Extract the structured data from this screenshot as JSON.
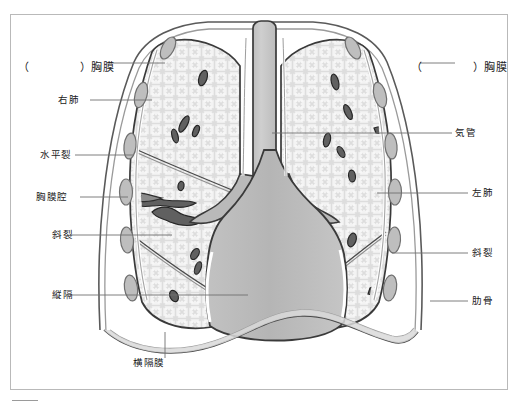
{
  "figure": {
    "title_visible": false,
    "frame": {
      "stroke": "#b9b9b9"
    },
    "colors": {
      "lung_fill": "#f2f2f2",
      "lung_mesh": "#d6d6d6",
      "lung_outline": "#3a3a3a",
      "pleura_fill": "#c9c9c9",
      "mediastinum_fill": "#b9b9b9",
      "mediastinum_outline": "#3a3a3a",
      "trachea_fill": "#c3c3c3",
      "rib_fill": "#bdbdbd",
      "rib_outline": "#6e6e6e",
      "vessel_fill": "#5f5f5f",
      "vessel_outline": "#2a2a2a",
      "diaphragm_fill": "#d8d8d8",
      "leader_line": "#6b6b6b",
      "text": "#1b1b1b"
    }
  },
  "labels": {
    "left": [
      {
        "id": "pleura-left-blank",
        "text": "）胸膜",
        "prefix": "（",
        "blank": true,
        "x": 18,
        "y": 66,
        "leader_to_x": 160
      },
      {
        "id": "right-lung",
        "text": "右肺",
        "x": 58,
        "y": 97,
        "leader_to_x": 152
      },
      {
        "id": "horizontal-fissure",
        "text": "水平裂",
        "x": 40,
        "y": 152,
        "leader_to_x": 133
      },
      {
        "id": "pleural-cavity",
        "text": "胸膜腔",
        "x": 36,
        "y": 194,
        "leader_to_x": 128
      },
      {
        "id": "oblique-fissure-l",
        "text": "斜裂",
        "x": 52,
        "y": 232,
        "leader_to_x": 170
      },
      {
        "id": "mediastinum",
        "text": "縦隔",
        "x": 52,
        "y": 292,
        "leader_to_x": 245
      }
    ],
    "right": [
      {
        "id": "pleura-right-blank",
        "text": "）胸膜",
        "prefix": "（",
        "blank": true,
        "x": 463,
        "y": 66,
        "leader_to_x": 400
      },
      {
        "id": "trachea",
        "text": "気管",
        "x": 455,
        "y": 130,
        "leader_to_x": 272
      },
      {
        "id": "left-lung",
        "text": "左肺",
        "x": 472,
        "y": 190,
        "leader_to_x": 377
      },
      {
        "id": "oblique-fissure-r",
        "text": "斜裂",
        "x": 472,
        "y": 250,
        "leader_to_x": 390
      },
      {
        "id": "rib",
        "text": "肋骨",
        "x": 472,
        "y": 298,
        "leader_to_x": 430
      }
    ],
    "bottom": [
      {
        "id": "diaphragm",
        "text": "横隔膜",
        "x": 133,
        "y": 362,
        "leader_to_y": 330
      }
    ]
  }
}
